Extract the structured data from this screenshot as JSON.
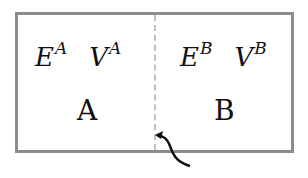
{
  "diagram": {
    "left_compartment": {
      "energy_symbol": "E",
      "energy_superscript": "A",
      "volume_symbol": "V",
      "volume_superscript": "A",
      "label": "A"
    },
    "right_compartment": {
      "energy_symbol": "E",
      "energy_superscript": "B",
      "volume_symbol": "V",
      "volume_superscript": "B",
      "label": "B"
    },
    "partition": "dashed wall between A and B",
    "colors": {
      "border": "#8c8c8c",
      "partition": "#c0c0c0",
      "text": "#111111"
    }
  }
}
